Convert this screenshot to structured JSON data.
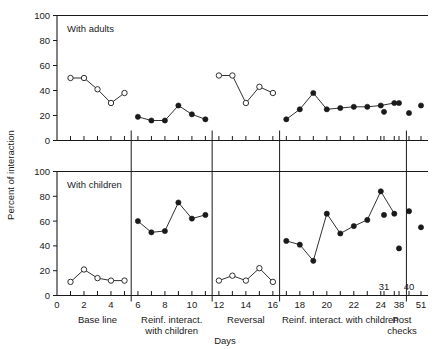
{
  "figure": {
    "ylabel": "Percent of interaction",
    "xlabel": "Days"
  },
  "panels": [
    {
      "id": "adults",
      "title": "With adults"
    },
    {
      "id": "children",
      "title": "With children"
    }
  ],
  "axis": {
    "y_ticks": [
      0,
      20,
      40,
      60,
      80,
      100
    ],
    "y_tick_labels": [
      "0",
      "20",
      "40",
      "60",
      "80",
      "100"
    ],
    "y_range": [
      0,
      100
    ],
    "x_range": [
      0,
      27.5
    ],
    "x_major_ticks": [
      0,
      2,
      4,
      6,
      8,
      10,
      12,
      14,
      16,
      18,
      20,
      22,
      24
    ],
    "x_major_tick_labels": [
      "0",
      "2",
      "4",
      "6",
      "8",
      "10",
      "12",
      "14",
      "16",
      "18",
      "20",
      "22",
      "24"
    ],
    "x_post_ticks": [
      31,
      38,
      40,
      51
    ],
    "x_post_tick_labels_upper": [
      "31",
      "40"
    ],
    "x_post_tick_labels_lower": [
      "38",
      "51"
    ]
  },
  "phases": [
    {
      "name": "base-line",
      "label": "Base line",
      "label_line2": ""
    },
    {
      "name": "reinf-interact-with-children-1",
      "label": "Reinf. interact.",
      "label_line2": "with children"
    },
    {
      "name": "reversal",
      "label": "Reversal",
      "label_line2": ""
    },
    {
      "name": "reinf-interact-with-children-2",
      "label": "Reinf. interact. with children",
      "label_line2": ""
    },
    {
      "name": "post-checks",
      "label": "Post",
      "label_line2": "checks"
    }
  ],
  "chart_data": {
    "type": "line",
    "title": "",
    "xlabel": "Days",
    "ylabel": "Percent of interaction",
    "ylim": [
      0,
      100
    ],
    "xlim": [
      0,
      27.5
    ],
    "grid": false,
    "legend": "none",
    "panels": [
      {
        "name": "With adults",
        "series": [
          {
            "name": "Base line",
            "marker": "open-circle",
            "x": [
              1,
              2,
              3,
              4,
              5
            ],
            "y": [
              50,
              50,
              41,
              30,
              38
            ]
          },
          {
            "name": "Reinf. interact. with children",
            "marker": "filled-circle",
            "x": [
              6,
              7,
              8,
              9,
              10,
              11
            ],
            "y": [
              19,
              16,
              16,
              28,
              21,
              17
            ]
          },
          {
            "name": "Reversal",
            "marker": "open-circle",
            "x": [
              12,
              13,
              14,
              15,
              16
            ],
            "y": [
              52,
              52,
              30,
              43,
              38
            ]
          },
          {
            "name": "Reinf. interact. with children 2",
            "marker": "filled-circle",
            "x": [
              17,
              18,
              19,
              20,
              21,
              22,
              23,
              24,
              25
            ],
            "y": [
              17,
              25,
              38,
              25,
              26,
              27,
              27,
              28,
              30
            ]
          },
          {
            "name": "Post checks",
            "marker": "filled-circle",
            "x": [
              31,
              38,
              40,
              51
            ],
            "y": [
              23,
              30,
              22,
              28
            ]
          }
        ]
      },
      {
        "name": "With children",
        "series": [
          {
            "name": "Base line",
            "marker": "open-circle",
            "x": [
              1,
              2,
              3,
              4,
              5
            ],
            "y": [
              11,
              21,
              14,
              12,
              12
            ]
          },
          {
            "name": "Reinf. interact. with children",
            "marker": "filled-circle",
            "x": [
              6,
              7,
              8,
              9,
              10,
              11
            ],
            "y": [
              60,
              51,
              52,
              75,
              62,
              65
            ]
          },
          {
            "name": "Reversal",
            "marker": "open-circle",
            "x": [
              12,
              13,
              14,
              15,
              16
            ],
            "y": [
              12,
              16,
              12,
              22,
              11
            ]
          },
          {
            "name": "Reinf. interact. with children 2",
            "marker": "filled-circle",
            "x": [
              17,
              18,
              19,
              20,
              21,
              22,
              23,
              24,
              25
            ],
            "y": [
              44,
              41,
              28,
              66,
              50,
              56,
              61,
              84,
              66
            ]
          },
          {
            "name": "Post checks",
            "marker": "filled-circle",
            "x": [
              31,
              38,
              40,
              51
            ],
            "y": [
              65,
              38,
              68,
              55
            ]
          }
        ]
      }
    ]
  }
}
